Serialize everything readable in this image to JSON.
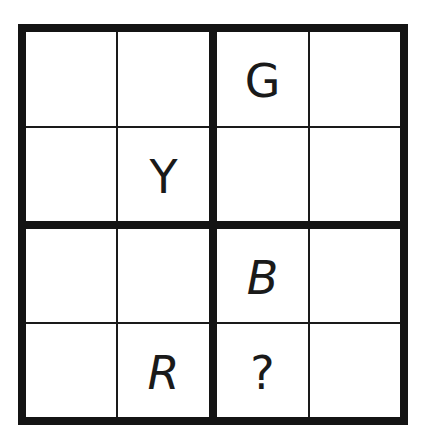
{
  "puzzle": {
    "type": "4x4 latin-square letter grid",
    "size": 4,
    "cells": [
      [
        "",
        "",
        "G",
        ""
      ],
      [
        "",
        "Y",
        "",
        ""
      ],
      [
        "",
        "",
        "B",
        ""
      ],
      [
        "",
        "R",
        "?",
        ""
      ]
    ],
    "italic_cells": [
      [
        2,
        2
      ],
      [
        3,
        1
      ]
    ],
    "line_color": "#141414",
    "background": "#ffffff"
  }
}
